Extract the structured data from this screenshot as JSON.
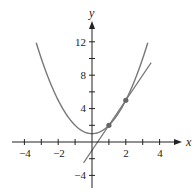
{
  "chart_data": {
    "type": "line",
    "title": "",
    "xlabel": "x",
    "ylabel": "y",
    "xlim": [
      -4.5,
      5
    ],
    "ylim": [
      -5,
      14
    ],
    "x_ticks": [
      -4,
      -3,
      -2,
      -1,
      0,
      1,
      2,
      3,
      4
    ],
    "x_tick_labels": [
      {
        "value": -4,
        "label": "−4"
      },
      {
        "value": -2,
        "label": "−2"
      },
      {
        "value": 2,
        "label": "2"
      },
      {
        "value": 4,
        "label": "4"
      }
    ],
    "y_ticks": [
      -4,
      -2,
      2,
      4,
      6,
      8,
      10,
      12
    ],
    "y_tick_labels": [
      {
        "value": 12,
        "label": "12"
      },
      {
        "value": 8,
        "label": "8"
      },
      {
        "value": 4,
        "label": "4"
      },
      {
        "value": -4,
        "label": "−4"
      }
    ],
    "grid": false,
    "series": [
      {
        "name": "curve",
        "expression": "y = x^2 + 1",
        "x_range": [
          -3.3,
          3.3
        ],
        "color": "#777777"
      },
      {
        "name": "secant line",
        "expression": "y = 3x - 1",
        "x_range": [
          -0.5,
          3.5
        ],
        "color": "#777777"
      }
    ],
    "points": [
      {
        "x": 1,
        "y": 2
      },
      {
        "x": 2,
        "y": 5
      }
    ],
    "colors": {
      "axes": "#222222",
      "curve": "#777777",
      "line": "#777777",
      "points": "#666666"
    }
  },
  "labels": {
    "x_axis": "x",
    "y_axis": "y",
    "xt_m4": "−4",
    "xt_m2": "−2",
    "xt_2": "2",
    "xt_4": "4",
    "yt_12": "12",
    "yt_8": "8",
    "yt_4": "4",
    "yt_m4": "−4"
  }
}
